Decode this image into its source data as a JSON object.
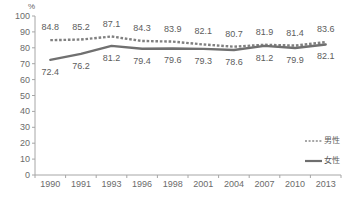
{
  "chart_data": {
    "type": "line",
    "title": "",
    "xlabel": "",
    "ylabel": "",
    "unit_label": "%",
    "categories": [
      "1990",
      "1991",
      "1993",
      "1996",
      "1998",
      "2001",
      "2004",
      "2007",
      "2010",
      "2013"
    ],
    "ylim": [
      0,
      100
    ],
    "y_ticks": [
      "0",
      "10",
      "20",
      "30",
      "40",
      "50",
      "60",
      "70",
      "80",
      "90",
      "100"
    ],
    "grid": false,
    "legend_position": "right-middle",
    "series": [
      {
        "name": "男性",
        "style": "dashed",
        "color": "#808080",
        "values": [
          84.8,
          85.2,
          87.1,
          84.3,
          83.9,
          82.1,
          80.7,
          81.9,
          81.4,
          83.6
        ],
        "labels": [
          "84.8",
          "85.2",
          "87.1",
          "84.3",
          "83.9",
          "82.1",
          "80.7",
          "81.9",
          "81.4",
          "83.6"
        ]
      },
      {
        "name": "女性",
        "style": "solid",
        "color": "#707070",
        "values": [
          72.4,
          76.2,
          81.2,
          79.4,
          79.6,
          79.3,
          78.6,
          81.2,
          79.9,
          82.1
        ],
        "labels": [
          "72.4",
          "76.2",
          "81.2",
          "79.4",
          "79.6",
          "79.3",
          "78.6",
          "81.2",
          "79.9",
          "82.1"
        ]
      }
    ]
  },
  "legend": {
    "items": [
      {
        "label": "男性",
        "style": "dashed"
      },
      {
        "label": "女性",
        "style": "solid"
      }
    ]
  },
  "axis": {
    "line_color": "#a6a6a6"
  }
}
